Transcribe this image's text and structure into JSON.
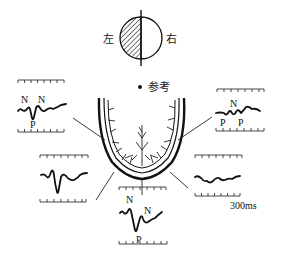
{
  "figure": {
    "type": "visual-evoked-potential-diagram",
    "visual_field": {
      "left_label": "左",
      "right_label": "右",
      "left_half_pattern": "hatched",
      "right_half_pattern": "blank"
    },
    "reference_label": "参考",
    "scale_label": "300ms",
    "peak_labels": {
      "n": "N",
      "p": "P"
    },
    "panels": [
      {
        "id": "upper-left",
        "peaks": [
          "N",
          "N",
          "P"
        ]
      },
      {
        "id": "middle-left",
        "peaks": []
      },
      {
        "id": "bottom-center",
        "peaks": [
          "N",
          "N",
          "P"
        ]
      },
      {
        "id": "lower-right",
        "peaks": []
      },
      {
        "id": "upper-right",
        "peaks": [
          "N",
          "P",
          "P"
        ]
      }
    ]
  }
}
